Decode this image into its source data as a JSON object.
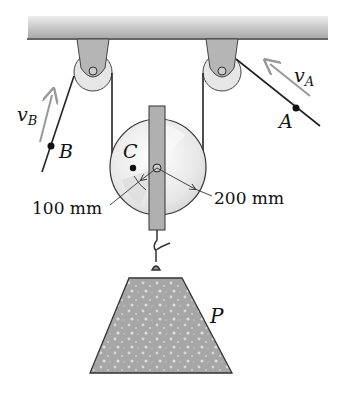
{
  "diagram": {
    "type": "pulley system",
    "labels": {
      "point_a": "A",
      "point_b": "B",
      "point_c": "C",
      "load": "P",
      "velocity_a": "v",
      "velocity_a_sub": "A",
      "velocity_b": "v",
      "velocity_b_sub": "B",
      "inner_radius": "100 mm",
      "outer_radius": "200 mm"
    },
    "colors": {
      "ceiling": "#bdbdbd",
      "bracket": "#b8b8b8",
      "pulley": "#e8e8e8",
      "rope": "#222222",
      "arrow": "#999999",
      "load": "#a9a9a9"
    }
  }
}
